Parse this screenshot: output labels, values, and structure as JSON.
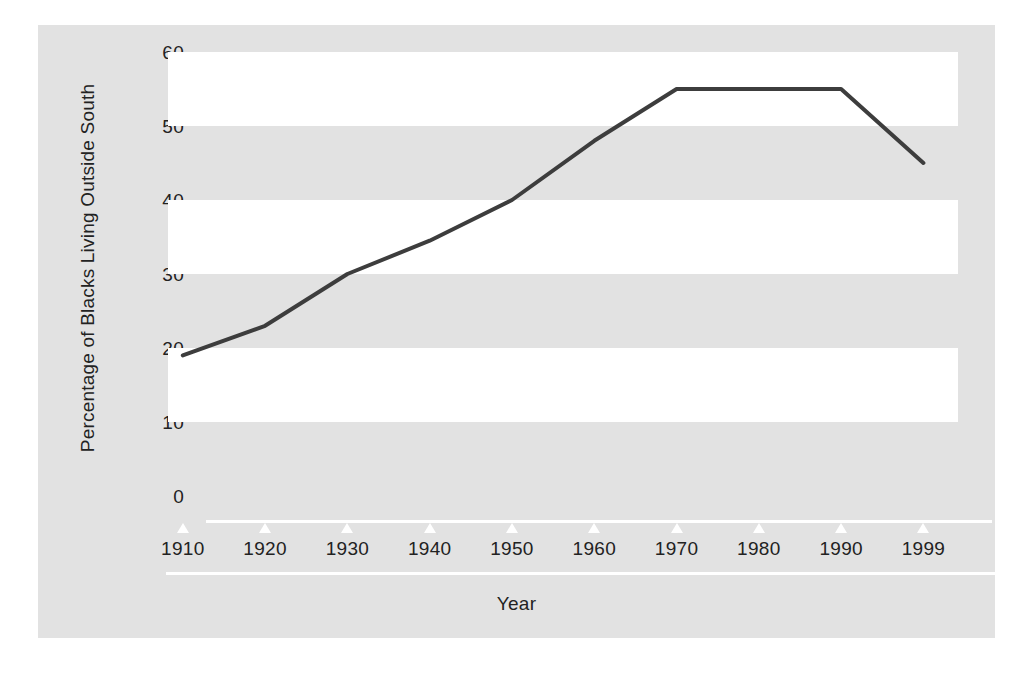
{
  "chart_data": {
    "type": "line",
    "title": "",
    "xlabel": "Year",
    "ylabel": "Percentage of Blacks Living Outside South",
    "categories": [
      "1910",
      "1920",
      "1930",
      "1940",
      "1950",
      "1960",
      "1970",
      "1980",
      "1990",
      "1999"
    ],
    "x": [
      1910,
      1920,
      1930,
      1940,
      1950,
      1960,
      1970,
      1980,
      1990,
      1999
    ],
    "values": [
      19,
      23,
      30,
      34.5,
      40,
      48,
      55,
      55,
      55,
      45
    ],
    "series": [
      {
        "name": "Percentage of Blacks Living Outside South",
        "values": [
          19,
          23,
          30,
          34.5,
          40,
          48,
          55,
          55,
          55,
          45
        ]
      }
    ],
    "ylim": [
      0,
      60
    ],
    "yticks": [
      0,
      10,
      20,
      30,
      40,
      50,
      60
    ],
    "ytick_labels": [
      "0",
      "10",
      "20",
      "30",
      "40",
      "50",
      "60"
    ],
    "xtick_labels": [
      "1910",
      "1920",
      "1930",
      "1940",
      "1950",
      "1960",
      "1970",
      "1980",
      "1990",
      "1999"
    ],
    "grid": false,
    "banded_background": true,
    "bands": [
      [
        10,
        20
      ],
      [
        30,
        40
      ],
      [
        50,
        60
      ]
    ],
    "legend": null,
    "legend_position": "none",
    "annotations": [],
    "colors": {
      "figure_background": "#e2e2e2",
      "band_fill": "#ffffff",
      "line": "#3d3d3d",
      "axis": "#ffffff",
      "text": "#222222",
      "page_background": "#ffffff"
    },
    "line_width": 4
  }
}
